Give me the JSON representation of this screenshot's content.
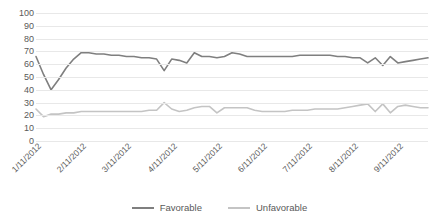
{
  "chart_data": {
    "type": "line",
    "title": "",
    "xlabel": "",
    "ylabel": "",
    "ylim": [
      0,
      100
    ],
    "ytick_step": 10,
    "yticks": [
      100,
      90,
      80,
      70,
      60,
      50,
      40,
      30,
      20,
      10,
      0
    ],
    "grid": true,
    "legend_position": "bottom",
    "x_tick_labels": [
      "1/11/2012",
      "2/11/2012",
      "3/11/2012",
      "4/11/2012",
      "5/11/2012",
      "6/11/2012",
      "7/11/2012",
      "8/11/2012",
      "9/11/2012"
    ],
    "x_tick_indices": [
      0,
      6,
      12,
      18,
      24,
      30,
      36,
      42,
      48
    ],
    "n_points": 53,
    "series": [
      {
        "name": "Favorable",
        "color": "#7f7f7f",
        "values": [
          66,
          52,
          40,
          48,
          57,
          64,
          69,
          69,
          68,
          68,
          67,
          67,
          66,
          66,
          65,
          65,
          64,
          55,
          64,
          63,
          61,
          69,
          66,
          66,
          65,
          66,
          69,
          68,
          66,
          66,
          66,
          66,
          66,
          66,
          66,
          67,
          67,
          67,
          67,
          67,
          66,
          66,
          65,
          65,
          61,
          65,
          59,
          66,
          61,
          62,
          63,
          64,
          65
        ]
      },
      {
        "name": "Unfavorable",
        "color": "#c4c4c4",
        "values": [
          25,
          19,
          21,
          21,
          22,
          22,
          23,
          23,
          23,
          23,
          23,
          23,
          23,
          23,
          23,
          24,
          24,
          30,
          25,
          23,
          24,
          26,
          27,
          27,
          22,
          26,
          26,
          26,
          26,
          24,
          23,
          23,
          23,
          23,
          24,
          24,
          24,
          25,
          25,
          25,
          25,
          26,
          27,
          28,
          29,
          23,
          29,
          22,
          27,
          28,
          27,
          26,
          26
        ]
      }
    ],
    "legend": [
      {
        "label": "Favorable",
        "color": "#7f7f7f"
      },
      {
        "label": "Unfavorable",
        "color": "#c4c4c4"
      }
    ]
  }
}
